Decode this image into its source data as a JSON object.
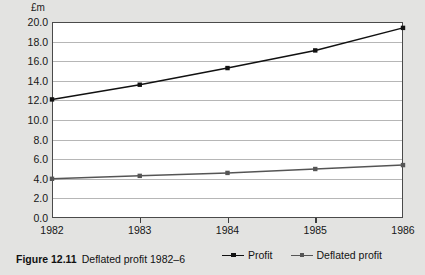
{
  "figure": {
    "caption_label": "Figure 12.11",
    "caption_text": "Deflated profit 1982–6"
  },
  "legend": {
    "position": "bottom-center",
    "items": [
      {
        "label": "Profit",
        "color": "#111111",
        "marker": "square-dot"
      },
      {
        "label": "Deflated profit",
        "color": "#555555",
        "marker": "square-dot"
      }
    ]
  },
  "axis": {
    "y_unit_label": "£m",
    "y_ticks": [
      "20.0",
      "18.0",
      "16.0",
      "14.0",
      "12.0",
      "10.0",
      "8.0",
      "6.0",
      "4.0",
      "2.0",
      "0.0"
    ],
    "x_ticks": [
      "1982",
      "1983",
      "1984",
      "1985",
      "1986"
    ]
  },
  "chart_data": {
    "type": "line",
    "title": "Deflated profit 1982–6",
    "xlabel": "",
    "ylabel": "£m",
    "ylim": [
      0.0,
      20.0
    ],
    "ytick_step": 2.0,
    "grid": true,
    "x": [
      "1982",
      "1983",
      "1984",
      "1985",
      "1986"
    ],
    "series": [
      {
        "name": "Profit",
        "values": [
          12.1,
          13.6,
          15.3,
          17.1,
          19.4
        ],
        "color": "#111111"
      },
      {
        "name": "Deflated profit",
        "values": [
          4.0,
          4.3,
          4.6,
          5.0,
          5.4
        ],
        "color": "#555555"
      }
    ]
  }
}
